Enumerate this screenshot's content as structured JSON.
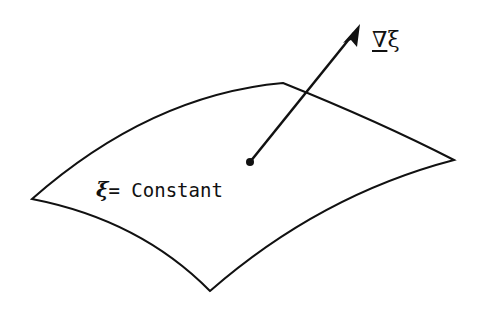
{
  "figure": {
    "surface_label": {
      "symbol": "ξ",
      "equals": "=",
      "text": " Constant"
    },
    "gradient_label": {
      "nabla": "∇",
      "symbol": "ξ"
    },
    "colors": {
      "stroke": "#111111",
      "background": "#ffffff"
    }
  }
}
